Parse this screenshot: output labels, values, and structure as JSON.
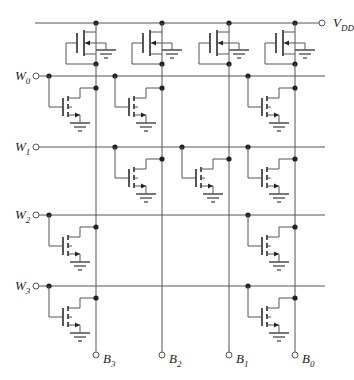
{
  "diagram": {
    "title": "",
    "type": "NMOS ROM array (4 words x 4 bits)",
    "supply": {
      "label": "V",
      "sub": "DD"
    },
    "word_lines": [
      {
        "label": "W",
        "sub": "0",
        "cells": [
          true,
          true,
          false,
          true
        ]
      },
      {
        "label": "W",
        "sub": "1",
        "cells": [
          false,
          true,
          true,
          true
        ]
      },
      {
        "label": "W",
        "sub": "2",
        "cells": [
          true,
          false,
          false,
          true
        ]
      },
      {
        "label": "W",
        "sub": "3",
        "cells": [
          true,
          false,
          false,
          true
        ]
      }
    ],
    "bit_lines": [
      {
        "label": "B",
        "sub": "3"
      },
      {
        "label": "B",
        "sub": "2"
      },
      {
        "label": "B",
        "sub": "1"
      },
      {
        "label": "B",
        "sub": "0"
      }
    ],
    "pullup_transistors": 4,
    "colors": {
      "wire": "#555555",
      "node": "#222222",
      "background": "#ffffff"
    }
  }
}
